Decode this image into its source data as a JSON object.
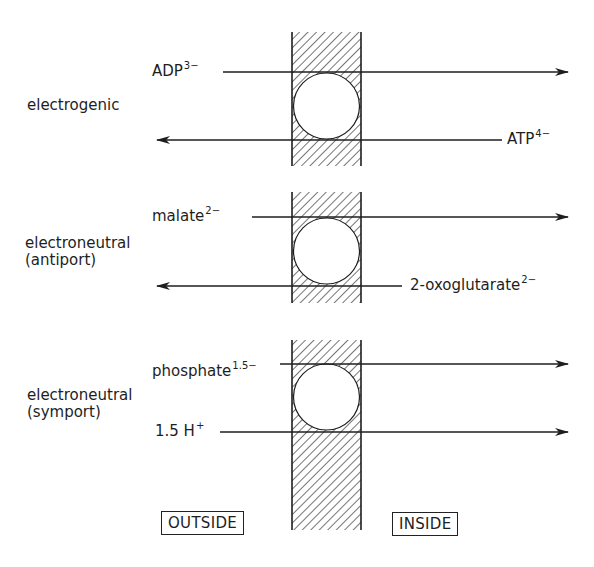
{
  "transporters": [
    {
      "type_label": "electrogenic",
      "type_sublabel": "",
      "top_species": {
        "name": "ADP",
        "charge": "3−",
        "direction": "outside-to-inside"
      },
      "bottom_species": {
        "name": "ATP",
        "charge": "4−",
        "direction": "inside-to-outside"
      }
    },
    {
      "type_label": "electroneutral",
      "type_sublabel": "(antiport)",
      "top_species": {
        "name": "malate",
        "charge": "2−",
        "direction": "outside-to-inside"
      },
      "bottom_species": {
        "name": "2-oxoglutarate",
        "charge": "2−",
        "direction": "inside-to-outside"
      }
    },
    {
      "type_label": "electroneutral",
      "type_sublabel": "(symport)",
      "top_species": {
        "name": "phosphate",
        "charge": "1.5−",
        "direction": "outside-to-inside"
      },
      "bottom_species": {
        "name": "1.5 H",
        "charge": "+",
        "direction": "outside-to-inside"
      }
    }
  ],
  "compartments": {
    "outside": "OUTSIDE",
    "inside": "INSIDE"
  },
  "icons": {
    "membrane": "hatched-membrane",
    "carrier": "circle-carrier",
    "arrow": "arrowhead"
  }
}
